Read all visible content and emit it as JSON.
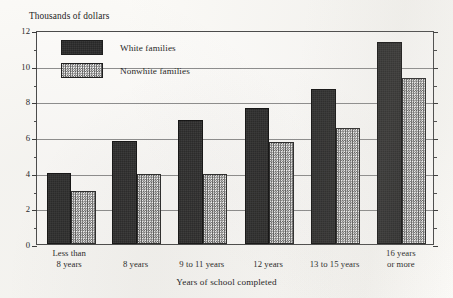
{
  "chart_data": {
    "type": "bar",
    "title": "",
    "xlabel": "Years of school completed",
    "ylabel": "Thousands of dollars",
    "categories": [
      "Less than\n8 years",
      "8 years",
      "9 to 11 years",
      "12 years",
      "13 to 15 years",
      "16 years\nor more"
    ],
    "series": [
      {
        "name": "White families",
        "values": [
          4.0,
          5.8,
          6.95,
          7.6,
          8.7,
          11.3
        ],
        "color": "#262626",
        "pattern": "solid-dark"
      },
      {
        "name": "Nonwhite families",
        "values": [
          2.95,
          3.9,
          3.95,
          5.7,
          6.5,
          9.3
        ],
        "color": "#5a5a5a",
        "pattern": "checkerboard-hatch"
      }
    ],
    "ylim": [
      0,
      12
    ],
    "yticks": [
      0,
      2,
      4,
      6,
      8,
      10,
      12
    ],
    "ytick_labels": [
      "0",
      "2",
      "4",
      "6",
      "8",
      "10",
      "12"
    ],
    "yticks_minor": [
      1,
      3,
      5,
      7,
      9,
      11
    ],
    "grid": "horizontal-major",
    "legend_position": "upper-left-inside"
  },
  "axis": {
    "y_title": "Thousands of dollars",
    "x_title": "Years of school completed"
  },
  "legend": {
    "items": [
      {
        "label": "White families"
      },
      {
        "label": "Nonwhite families"
      }
    ]
  }
}
